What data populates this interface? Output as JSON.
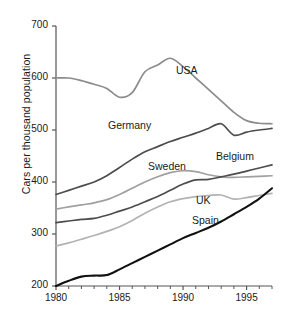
{
  "chart_data": {
    "type": "line",
    "title": "",
    "xlabel": "",
    "ylabel": "Cars per thousand population",
    "xlim": [
      1980,
      1997
    ],
    "ylim": [
      200,
      700
    ],
    "yticks": [
      200,
      300,
      400,
      500,
      600,
      700
    ],
    "ytick_labels": [
      "200",
      "300",
      "400",
      "500",
      "600",
      "700"
    ],
    "xticks": [
      1980,
      1985,
      1990,
      1995
    ],
    "xtick_labels": [
      "1980",
      "1985",
      "1990",
      "1995"
    ],
    "x_minor_ticks": [
      1981,
      1982,
      1983,
      1984,
      1986,
      1987,
      1988,
      1989,
      1991,
      1992,
      1993,
      1994,
      1996,
      1997
    ],
    "grid": false,
    "legend_position": "inline-labels",
    "x": [
      1980,
      1981,
      1982,
      1983,
      1984,
      1985,
      1986,
      1987,
      1988,
      1989,
      1990,
      1991,
      1992,
      1993,
      1994,
      1995,
      1996,
      1997
    ],
    "series": [
      {
        "name": "USA",
        "color": "#8c8c8c",
        "label_x": 176,
        "label_y": 64,
        "values": [
          600,
          600,
          595,
          588,
          580,
          563,
          572,
          612,
          625,
          638,
          622,
          600,
          578,
          556,
          534,
          518,
          513,
          512
        ]
      },
      {
        "name": "Germany",
        "color": "#4d4d4d",
        "label_x": 108,
        "label_y": 119,
        "values": [
          376,
          384,
          392,
          400,
          412,
          428,
          444,
          458,
          468,
          478,
          486,
          494,
          503,
          512,
          490,
          496,
          500,
          503
        ]
      },
      {
        "name": "Sweden",
        "color": "#a0a0a0",
        "label_x": 148,
        "label_y": 160,
        "values": [
          348,
          352,
          356,
          360,
          366,
          376,
          388,
          400,
          410,
          418,
          422,
          420,
          414,
          410,
          409,
          410,
          411,
          412
        ]
      },
      {
        "name": "Belgium",
        "color": "#4d4d4d",
        "label_x": 216,
        "label_y": 150,
        "values": [
          322,
          325,
          328,
          330,
          336,
          344,
          352,
          362,
          372,
          384,
          396,
          404,
          405,
          410,
          415,
          421,
          427,
          433
        ]
      },
      {
        "name": "UK",
        "color": "#b3b3b3",
        "label_x": 196,
        "label_y": 194,
        "values": [
          277,
          283,
          290,
          297,
          305,
          314,
          326,
          340,
          352,
          362,
          368,
          372,
          374,
          375,
          367,
          370,
          374,
          378
        ]
      },
      {
        "name": "Spain",
        "color": "#111111",
        "label_x": 192,
        "label_y": 214,
        "values": [
          200,
          210,
          218,
          220,
          221,
          232,
          244,
          256,
          268,
          280,
          292,
          302,
          312,
          324,
          338,
          352,
          368,
          388
        ]
      }
    ]
  },
  "axis": {
    "axis_color": "#555555",
    "tick_color": "#555555"
  }
}
